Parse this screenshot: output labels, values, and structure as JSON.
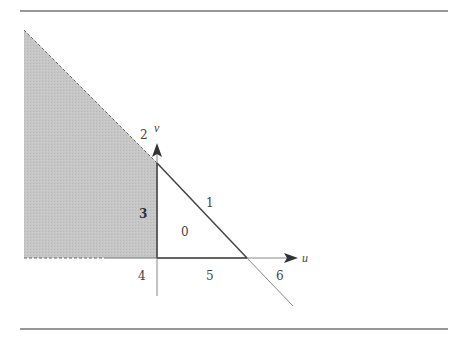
{
  "diagram": {
    "axes": {
      "horizontal": "u",
      "vertical": "v"
    },
    "region_labels": [
      {
        "id": "0",
        "text": "0"
      },
      {
        "id": "1",
        "text": "1"
      },
      {
        "id": "2",
        "text": "2"
      },
      {
        "id": "3",
        "text": "3"
      },
      {
        "id": "4",
        "text": "4"
      },
      {
        "id": "5",
        "text": "5"
      },
      {
        "id": "6",
        "text": "6"
      }
    ],
    "colors": {
      "shade": "#c4c4c4",
      "line": "#555555",
      "rule": "#333333"
    },
    "shaded_region": "3"
  }
}
